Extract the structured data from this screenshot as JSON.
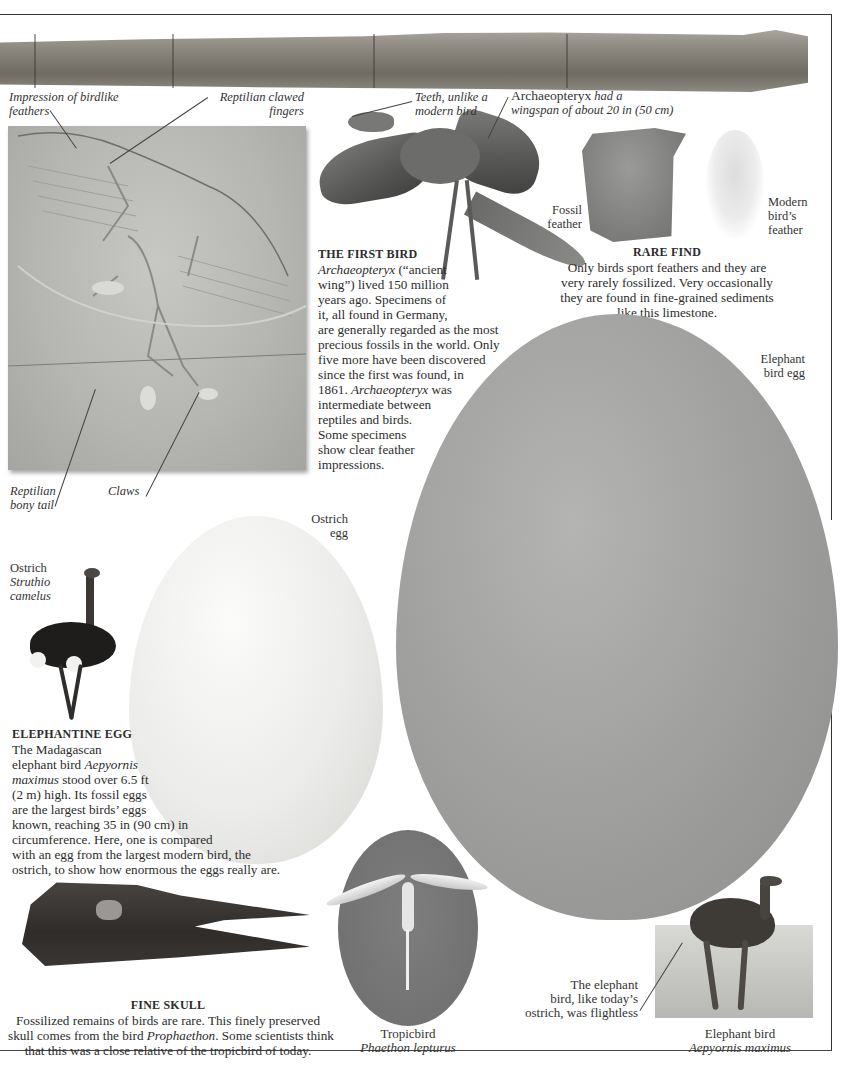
{
  "page": {
    "background": "#ffffff",
    "rule_color": "#333333"
  },
  "archaeopteryx_fossil": {
    "labels": {
      "feathers": "Impression of birdlike feathers",
      "feathers_line1": "Impression of birdlike",
      "feathers_line2": "feathers",
      "fingers_line1": "Reptilian clawed",
      "fingers_line2": "fingers",
      "tail_line1": "Reptilian",
      "tail_line2": "bony tail",
      "claws": "Claws"
    }
  },
  "archaeopteryx_model": {
    "labels": {
      "teeth_line1": "Teeth, unlike a",
      "teeth_line2": "modern bird",
      "wingspan_name": "Archaeopteryx",
      "wingspan_line1_rest": " had a",
      "wingspan_line2": "wingspan of about 20 in (50 cm)"
    }
  },
  "first_bird": {
    "heading": "THE FIRST BIRD",
    "lines": [
      {
        "italic": "Archaeopteryx",
        "text": " (“ancient"
      },
      {
        "text": "wing”) lived 150 million"
      },
      {
        "text": "years ago. Specimens of"
      },
      {
        "text": "it, all found in Germany,"
      },
      {
        "text": "are generally regarded as the most"
      },
      {
        "text": "precious fossils in the world. Only"
      },
      {
        "text": "five more have been discovered"
      },
      {
        "text": "since the first was found, in"
      },
      {
        "text": "1861. ",
        "italic_after": "Archaeopteryx",
        "after": " was"
      },
      {
        "text": "intermediate between"
      },
      {
        "text": "reptiles and birds."
      },
      {
        "text": "Some specimens"
      },
      {
        "text": "show clear feather"
      },
      {
        "text": "impressions."
      }
    ]
  },
  "rare_find": {
    "fossil_feather_line1": "Fossil",
    "fossil_feather_line2": "feather",
    "modern_feather_line1": "Modern",
    "modern_feather_line2": "bird’s",
    "modern_feather_line3": "feather",
    "heading": "RARE FIND",
    "lines": [
      "Only birds sport feathers and they are",
      "very rarely fossilized. Very occasionally",
      "they are found in fine-grained sediments",
      "like this limestone."
    ]
  },
  "eggs": {
    "elephant_egg_line1": "Elephant",
    "elephant_egg_line2": "bird egg",
    "ostrich_egg_line1": "Ostrich",
    "ostrich_egg_line2": "egg"
  },
  "ostrich": {
    "common": "Ostrich",
    "latin_line1": "Struthio",
    "latin_line2": "camelus"
  },
  "elephantine_egg": {
    "heading": "ELEPHANTINE EGG",
    "lines": [
      {
        "text": "The Madagascan"
      },
      {
        "text": "elephant bird ",
        "italic_after": "Aepyornis"
      },
      {
        "italic": "maximus",
        "text": " stood over 6.5 ft"
      },
      {
        "text": "(2 m) high. Its fossil eggs"
      },
      {
        "text": "are the largest birds’ eggs"
      },
      {
        "text": "known, reaching 35 in (90 cm) in"
      },
      {
        "text": "circumference. Here, one is compared"
      },
      {
        "text": "with an egg from the largest modern bird, the"
      },
      {
        "text": "ostrich, to show how enormous the eggs really are."
      }
    ]
  },
  "fine_skull": {
    "heading": "FINE SKULL",
    "line1": "Fossilized remains of birds are rare. This finely preserved",
    "line2_pre": "skull comes from the bird ",
    "line2_italic": "Prophaethon",
    "line2_post": ". Some scientists think",
    "line3": "that this was a close relative of the tropicbird of today."
  },
  "tropicbird": {
    "common": "Tropicbird",
    "latin": "Phaethon lepturus"
  },
  "elephant_bird": {
    "note_line1": "The elephant",
    "note_line2": "bird, like today’s",
    "note_line3": "ostrich, was flightless",
    "common": "Elephant bird",
    "latin": "Aepyornis maximus"
  }
}
